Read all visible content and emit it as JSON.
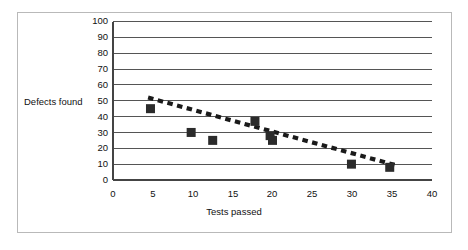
{
  "chart_data": {
    "type": "scatter",
    "title": "",
    "xlabel": "Tests passed",
    "ylabel": "Defects found",
    "xlim": [
      0,
      40
    ],
    "ylim": [
      0,
      100
    ],
    "xticks": [
      0,
      5,
      10,
      15,
      20,
      25,
      30,
      35,
      40
    ],
    "yticks": [
      0,
      10,
      20,
      30,
      40,
      50,
      60,
      70,
      80,
      90,
      100
    ],
    "grid": "horizontal",
    "legend": "none",
    "series": [
      {
        "name": "Defects found",
        "marker": "square",
        "color": "#2b2b2b",
        "points": [
          {
            "x": 4.7,
            "y": 45
          },
          {
            "x": 9.8,
            "y": 30
          },
          {
            "x": 12.5,
            "y": 25
          },
          {
            "x": 17.8,
            "y": 37
          },
          {
            "x": 19.7,
            "y": 28
          },
          {
            "x": 20.0,
            "y": 25
          },
          {
            "x": 29.9,
            "y": 10
          },
          {
            "x": 34.7,
            "y": 8
          }
        ]
      },
      {
        "name": "Trend line",
        "marker": "none",
        "style": "dashed",
        "color": "#1a1a1a",
        "points": [
          {
            "x": 4.4,
            "y": 52
          },
          {
            "x": 35.7,
            "y": 9
          }
        ]
      }
    ],
    "annotations": []
  },
  "axes": {
    "y_title": "Defects found",
    "x_title": "Tests passed",
    "y_tick_labels": [
      "100",
      "90",
      "80",
      "70",
      "60",
      "50",
      "40",
      "30",
      "20",
      "10",
      "0"
    ],
    "x_tick_labels": [
      "0",
      "5",
      "10",
      "15",
      "20",
      "25",
      "30",
      "35",
      "40"
    ]
  },
  "colors": {
    "frame": "#b9b9b9",
    "gridline": "#4a4a4a",
    "axis": "#4a4a4a",
    "marker": "#2b2b2b",
    "trendline": "#1a1a1a",
    "background": "#ffffff",
    "text": "#111111"
  }
}
